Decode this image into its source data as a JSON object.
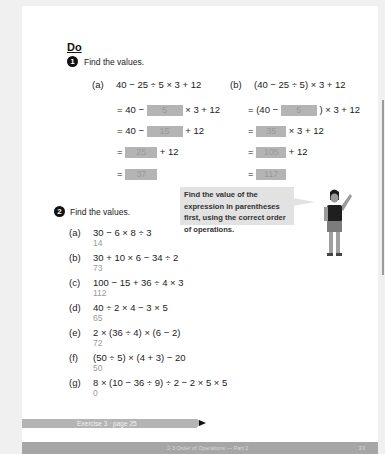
{
  "section": {
    "heading": "Do"
  },
  "q1": {
    "number": "1",
    "prompt": "Find the values.",
    "part_a": {
      "label": "(a)",
      "expression": "40 − 25 ÷ 5 × 3 + 12",
      "steps": [
        {
          "prefix": "= 40 −",
          "answer": "5",
          "suffix": "× 3 + 12"
        },
        {
          "prefix": "= 40 −",
          "answer": "15",
          "suffix": "+ 12"
        },
        {
          "prefix": "=",
          "answer": "25",
          "suffix": "+ 12"
        },
        {
          "prefix": "=",
          "answer": "37",
          "suffix": ""
        }
      ]
    },
    "part_b": {
      "label": "(b)",
      "expression": "(40 − 25 ÷ 5) × 3 + 12",
      "steps": [
        {
          "prefix": "= (40 −",
          "answer": "5",
          "suffix": ") × 3 + 12"
        },
        {
          "prefix": "=",
          "answer": "35",
          "suffix": "× 3 + 12"
        },
        {
          "prefix": "=",
          "answer": "105",
          "suffix": "+ 12"
        },
        {
          "prefix": "=",
          "answer": "117",
          "suffix": ""
        }
      ]
    }
  },
  "callout": {
    "text": "Find the value of the expression in parentheses first, using the correct order of operations."
  },
  "q2": {
    "number": "2",
    "prompt": "Find the values.",
    "items": [
      {
        "label": "(a)",
        "expression": "30 − 6 × 8 ÷ 3",
        "answer": "14"
      },
      {
        "label": "(b)",
        "expression": "30 + 10 × 6 − 34 ÷ 2",
        "answer": "73"
      },
      {
        "label": "(c)",
        "expression": "100 − 15 + 36 ÷ 4 × 3",
        "answer": "112"
      },
      {
        "label": "(d)",
        "expression": "40 ÷ 2 × 4 − 3 × 5",
        "answer": "65"
      },
      {
        "label": "(e)",
        "expression": "2 × (36 ÷ 4) × (6 − 2)",
        "answer": "72"
      },
      {
        "label": "(f)",
        "expression": "(50 ÷ 5) × (4 + 3) − 20",
        "answer": "50"
      },
      {
        "label": "(g)",
        "expression": "8 × (10 − 36 ÷ 9) ÷ 2 − 2 × 5 × 5",
        "answer": "0"
      }
    ]
  },
  "exercise": {
    "label": "Exercise 3 · page 25"
  },
  "footer": {
    "title": "2-3 Order of Operations — Part 2",
    "page_number": "33"
  }
}
